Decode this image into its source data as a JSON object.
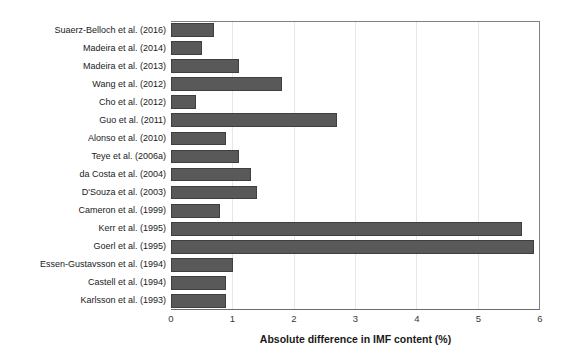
{
  "chart_data": {
    "type": "bar",
    "orientation": "horizontal",
    "title": "",
    "xlabel": "Absolute difference in IMF content (%)",
    "ylabel": "",
    "xlim": [
      0,
      6
    ],
    "xticks": [
      0,
      1,
      2,
      3,
      4,
      5,
      6
    ],
    "grid": "vertical gridlines at each integer, very light gray",
    "legend": "none",
    "categories": [
      "Suaerz-Belloch et al. (2016)",
      "Madeira et al. (2014)",
      "Madeira et al. (2013)",
      "Wang et al. (2012)",
      "Cho et al. (2012)",
      "Guo et al. (2011)",
      "Alonso et al. (2010)",
      "Teye et al. (2006a)",
      "da Costa et al. (2004)",
      "D'Souza et al. (2003)",
      "Cameron et al. (1999)",
      "Kerr et al. (1995)",
      "Goerl et al. (1995)",
      "Essen-Gustavsson et al. (1994)",
      "Castell et al. (1994)",
      "Karlsson et al. (1993)"
    ],
    "values": [
      0.7,
      0.5,
      1.1,
      1.8,
      0.4,
      2.7,
      0.9,
      1.1,
      1.3,
      1.4,
      0.8,
      5.7,
      5.9,
      1.0,
      0.9,
      0.9
    ],
    "bar_color": "#595959",
    "bar_border_color": "#3f3f3f",
    "axis_color": "#808080",
    "gridline_color": "#e7e7e7"
  }
}
